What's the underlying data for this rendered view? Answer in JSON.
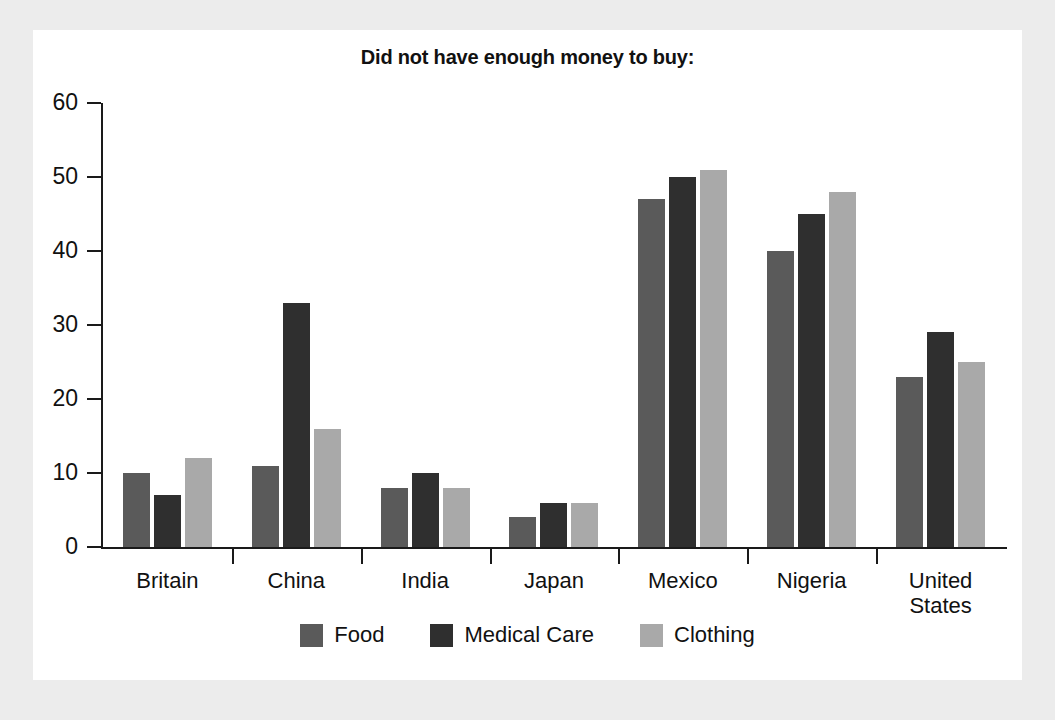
{
  "chart_data": {
    "type": "bar",
    "title": "Did not have enough money to buy:",
    "xlabel": "",
    "ylabel": "",
    "ylim": [
      0,
      60
    ],
    "yticks": [
      0,
      10,
      20,
      30,
      40,
      50,
      60
    ],
    "grid": false,
    "legend_position": "bottom",
    "categories": [
      "Britain",
      "China",
      "India",
      "Japan",
      "Mexico",
      "Nigeria",
      "United States"
    ],
    "series": [
      {
        "name": "Food",
        "color": "#5a5a5a",
        "values": [
          10,
          11,
          8,
          4,
          47,
          40,
          23
        ]
      },
      {
        "name": "Medical Care",
        "color": "#2f2f2f",
        "values": [
          7,
          33,
          10,
          6,
          50,
          45,
          29
        ]
      },
      {
        "name": "Clothing",
        "color": "#a9a9a9",
        "values": [
          12,
          16,
          8,
          6,
          51,
          48,
          25
        ]
      }
    ]
  },
  "axis": {
    "y_tick_labels": [
      "0",
      "10",
      "20",
      "30",
      "40",
      "50",
      "60"
    ]
  },
  "x_labels": [
    {
      "line1": "Britain",
      "line2": ""
    },
    {
      "line1": "China",
      "line2": ""
    },
    {
      "line1": "India",
      "line2": ""
    },
    {
      "line1": "Japan",
      "line2": ""
    },
    {
      "line1": "Mexico",
      "line2": ""
    },
    {
      "line1": "Nigeria",
      "line2": ""
    },
    {
      "line1": "United",
      "line2": "States"
    }
  ],
  "legend": [
    {
      "label": "Food",
      "color": "#5a5a5a"
    },
    {
      "label": "Medical Care",
      "color": "#2f2f2f"
    },
    {
      "label": "Clothing",
      "color": "#a9a9a9"
    }
  ],
  "colors": {
    "page_background": "#ececec",
    "card_background": "#ffffff",
    "axis": "#1a1a1a",
    "text": "#111111",
    "food": "#5a5a5a",
    "medical": "#2f2f2f",
    "clothing": "#a9a9a9"
  }
}
